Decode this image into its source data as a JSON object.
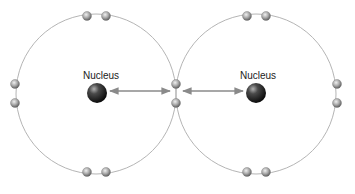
{
  "diagram": {
    "colors": {
      "orbit": "#b5b5b5",
      "arrow": "#8a8a8a",
      "nucleus_dark": "#111111",
      "nucleus_light": "#9a9a9a",
      "electron_dark": "#6f6f6f",
      "electron_light": "#e6e6e6",
      "label": "#222222"
    },
    "atoms": [
      {
        "name": "left-atom",
        "orbit": {
          "cx": 96,
          "cy": 94,
          "r": 80
        },
        "nucleus": {
          "cx": 97,
          "cy": 93,
          "r": 10,
          "label": "Nucleus",
          "label_x": 101,
          "label_y": 79
        }
      },
      {
        "name": "right-atom",
        "orbit": {
          "cx": 256,
          "cy": 94,
          "r": 80
        },
        "nucleus": {
          "cx": 256,
          "cy": 93,
          "r": 10,
          "label": "Nucleus",
          "label_x": 258,
          "label_y": 79
        }
      }
    ],
    "electrons": [
      {
        "cx": 87,
        "cy": 16,
        "group": "left-top"
      },
      {
        "cx": 106,
        "cy": 16,
        "group": "left-top"
      },
      {
        "cx": 15,
        "cy": 84,
        "group": "left-side"
      },
      {
        "cx": 15,
        "cy": 103,
        "group": "left-side"
      },
      {
        "cx": 87,
        "cy": 172,
        "group": "left-bottom"
      },
      {
        "cx": 106,
        "cy": 172,
        "group": "left-bottom"
      },
      {
        "cx": 247,
        "cy": 16,
        "group": "right-top"
      },
      {
        "cx": 266,
        "cy": 16,
        "group": "right-top"
      },
      {
        "cx": 337,
        "cy": 84,
        "group": "right-side"
      },
      {
        "cx": 337,
        "cy": 103,
        "group": "right-side"
      },
      {
        "cx": 247,
        "cy": 172,
        "group": "right-bottom"
      },
      {
        "cx": 266,
        "cy": 172,
        "group": "right-bottom"
      },
      {
        "cx": 176,
        "cy": 84,
        "group": "shared"
      },
      {
        "cx": 176,
        "cy": 103,
        "group": "shared"
      }
    ],
    "electron_radius": 4.5,
    "arrows": [
      {
        "name": "left-attraction-arrow",
        "x1": 110,
        "y1": 91,
        "x2": 170,
        "y2": 91
      },
      {
        "name": "right-attraction-arrow",
        "x1": 183,
        "y1": 91,
        "x2": 243,
        "y2": 91
      }
    ]
  }
}
